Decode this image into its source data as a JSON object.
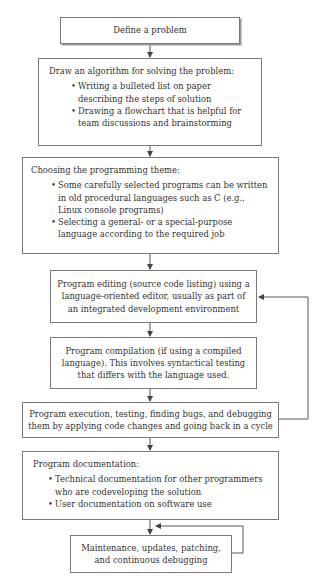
{
  "flowchart": {
    "steps": [
      {
        "id": "define",
        "title": "Define a problem",
        "bullets": []
      },
      {
        "id": "algorithm",
        "title": "Draw an algorithm for solving the problem:",
        "bullets": [
          "Writing a bulleted list on paper describing the steps of solution",
          "Drawing a flowchart that is helpful for team discussions and brainstorming"
        ]
      },
      {
        "id": "theme",
        "title": "Choosing the programming theme:",
        "bullets": [
          "Some carefully selected programs can be written in old procedural languages such as C (e.g., Linux console programs)",
          "Selecting a general- or a special-purpose language according to the required job"
        ]
      },
      {
        "id": "editing",
        "title": "Program editing (source code listing) using a language-oriented editor, usually as part of an integrated development environment",
        "bullets": []
      },
      {
        "id": "compilation",
        "title": "Program compilation (if using a compiled language). This involves syntactical testing that differs with the language used.",
        "bullets": []
      },
      {
        "id": "execution",
        "title": "Program execution, testing, finding bugs, and debugging them by applying code changes and going back in a cycle",
        "bullets": []
      },
      {
        "id": "documentation",
        "title": "Program documentation:",
        "bullets": [
          "Technical documentation for other programmers who are codeveloping the solution",
          "User documentation on software use"
        ]
      },
      {
        "id": "maintenance",
        "title": "Maintenance, updates, patching, and continuous debugging",
        "bullets": []
      }
    ],
    "loops": [
      {
        "from": "execution",
        "to": "editing",
        "label": ""
      },
      {
        "from": "maintenance",
        "to": "maintenance",
        "label": ""
      }
    ],
    "colors": {
      "line": "#555555",
      "border": "#7a7a7a",
      "text": "#333333"
    }
  }
}
